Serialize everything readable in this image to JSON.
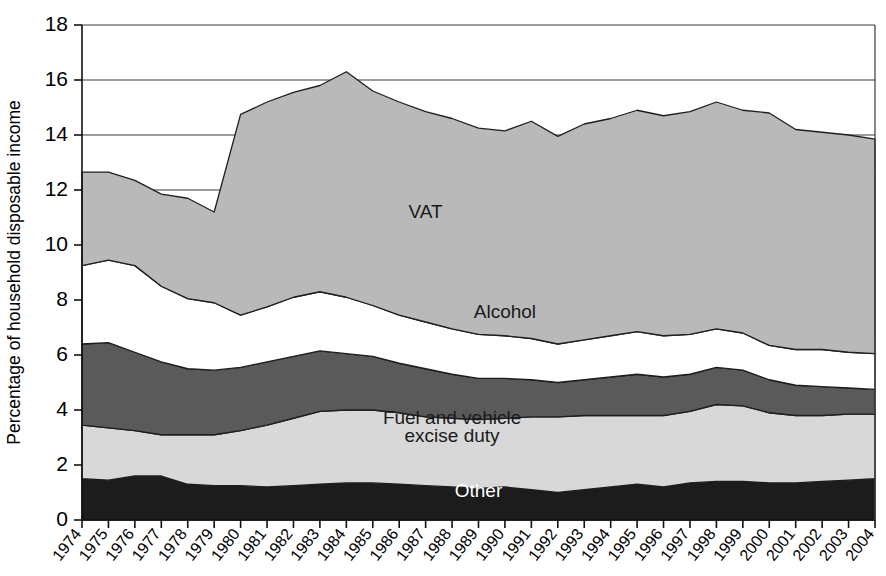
{
  "chart_data": {
    "type": "area",
    "stacked": true,
    "title": "",
    "subtitle": "",
    "xlabel": "",
    "ylabel": "Percentage of household disposable income",
    "ylim": [
      0,
      18
    ],
    "yticks": [
      0,
      2,
      4,
      6,
      8,
      10,
      12,
      14,
      16,
      18
    ],
    "ytick_labels": [
      "0",
      "2",
      "4",
      "6",
      "8",
      "10",
      "12",
      "14",
      "16",
      "18"
    ],
    "grid": "horizontal",
    "legend_position": "inline-labels",
    "categories": [
      "1974",
      "1975",
      "1976",
      "1977",
      "1978",
      "1979",
      "1980",
      "1981",
      "1982",
      "1983",
      "1984",
      "1985",
      "1986",
      "1987",
      "1988",
      "1989",
      "1990",
      "1991",
      "1992",
      "1993",
      "1994",
      "1995",
      "1996",
      "1997",
      "1998",
      "1999",
      "2000",
      "2001",
      "2002",
      "2003",
      "2004"
    ],
    "series": [
      {
        "name": "Other",
        "color": "#1c1c1c",
        "label_color": "light",
        "values": [
          1.5,
          1.45,
          1.6,
          1.6,
          1.3,
          1.25,
          1.25,
          1.2,
          1.25,
          1.3,
          1.35,
          1.35,
          1.3,
          1.25,
          1.2,
          1.15,
          1.2,
          1.1,
          1.0,
          1.1,
          1.2,
          1.3,
          1.2,
          1.35,
          1.4,
          1.4,
          1.35,
          1.35,
          1.4,
          1.45,
          1.5
        ]
      },
      {
        "name": "Fuel and vehicle excise duty",
        "color": "#d8d8d8",
        "label_color": "dark",
        "values": [
          1.95,
          1.9,
          1.65,
          1.5,
          1.8,
          1.85,
          2.0,
          2.25,
          2.45,
          2.65,
          2.65,
          2.65,
          2.6,
          2.5,
          2.5,
          2.5,
          2.5,
          2.65,
          2.75,
          2.7,
          2.6,
          2.5,
          2.6,
          2.6,
          2.8,
          2.75,
          2.55,
          2.45,
          2.4,
          2.4,
          2.35
        ]
      },
      {
        "name": "Tobacco",
        "color": "#5a5a5a",
        "label_color": "light",
        "values": [
          2.95,
          3.1,
          2.85,
          2.65,
          2.4,
          2.35,
          2.3,
          2.3,
          2.25,
          2.2,
          2.05,
          1.95,
          1.8,
          1.75,
          1.6,
          1.5,
          1.45,
          1.35,
          1.25,
          1.3,
          1.4,
          1.5,
          1.4,
          1.35,
          1.35,
          1.3,
          1.2,
          1.1,
          1.05,
          0.95,
          0.9
        ]
      },
      {
        "name": "Alcohol",
        "color": "#ffffff",
        "label_color": "dark",
        "values": [
          2.85,
          3.0,
          3.15,
          2.75,
          2.55,
          2.45,
          1.9,
          2.0,
          2.15,
          2.15,
          2.05,
          1.85,
          1.75,
          1.7,
          1.65,
          1.6,
          1.55,
          1.5,
          1.4,
          1.45,
          1.5,
          1.55,
          1.5,
          1.45,
          1.4,
          1.35,
          1.25,
          1.3,
          1.35,
          1.3,
          1.3
        ]
      },
      {
        "name": "VAT",
        "color": "#b9b9b9",
        "label_color": "dark",
        "values": [
          3.4,
          3.2,
          3.1,
          3.35,
          3.65,
          3.3,
          7.3,
          7.45,
          7.45,
          7.5,
          7.9,
          7.8,
          7.75,
          7.65,
          7.65,
          7.5,
          7.45,
          7.9,
          7.55,
          7.85,
          7.9,
          8.05,
          8.0,
          8.1,
          8.25,
          8.1,
          8.45,
          8.0,
          7.9,
          7.9,
          7.8
        ]
      }
    ],
    "stack_tops": {
      "Other": [
        1.5,
        1.45,
        1.6,
        1.6,
        1.3,
        1.25,
        1.25,
        1.2,
        1.25,
        1.3,
        1.35,
        1.35,
        1.3,
        1.25,
        1.2,
        1.15,
        1.2,
        1.1,
        1.0,
        1.1,
        1.2,
        1.3,
        1.2,
        1.35,
        1.4,
        1.4,
        1.35,
        1.35,
        1.4,
        1.45,
        1.5
      ],
      "Fuel and vehicle excise duty": [
        3.45,
        3.35,
        3.25,
        3.1,
        3.1,
        3.1,
        3.25,
        3.45,
        3.7,
        3.95,
        4.0,
        4.0,
        3.9,
        3.75,
        3.7,
        3.65,
        3.7,
        3.75,
        3.75,
        3.8,
        3.8,
        3.8,
        3.8,
        3.95,
        4.2,
        4.15,
        3.9,
        3.8,
        3.8,
        3.85,
        3.85
      ],
      "Tobacco": [
        6.4,
        6.45,
        6.1,
        5.75,
        5.5,
        5.45,
        5.55,
        5.75,
        5.95,
        6.15,
        6.05,
        5.95,
        5.7,
        5.5,
        5.3,
        5.15,
        5.15,
        5.1,
        5.0,
        5.1,
        5.2,
        5.3,
        5.2,
        5.3,
        5.55,
        5.45,
        5.1,
        4.9,
        4.85,
        4.8,
        4.75
      ],
      "Alcohol": [
        9.25,
        9.45,
        9.25,
        8.5,
        8.05,
        7.9,
        7.45,
        7.75,
        8.1,
        8.3,
        8.1,
        7.8,
        7.45,
        7.2,
        6.95,
        6.75,
        6.7,
        6.6,
        6.4,
        6.55,
        6.7,
        6.85,
        6.7,
        6.75,
        6.95,
        6.8,
        6.35,
        6.2,
        6.2,
        6.1,
        6.05
      ],
      "VAT": [
        12.65,
        12.65,
        12.35,
        11.85,
        11.7,
        11.2,
        14.75,
        15.2,
        15.55,
        15.8,
        16.3,
        15.6,
        15.2,
        14.85,
        14.6,
        14.25,
        14.15,
        14.5,
        13.95,
        14.4,
        14.6,
        14.9,
        14.7,
        14.85,
        15.2,
        14.9,
        14.8,
        14.2,
        14.1,
        14.0,
        13.85
      ]
    },
    "series_labels": [
      {
        "text": "VAT",
        "x_year": "1987",
        "y_value": 11.0,
        "color_class": "dark"
      },
      {
        "text": "Alcohol",
        "x_year": "1990",
        "y_value": 7.35,
        "color_class": "dark"
      },
      {
        "text": "Tobacco",
        "x_year": "1989",
        "y_value": 5.45,
        "color_class": "light"
      },
      {
        "text": "Fuel and vehicle",
        "x_year": "1988",
        "y_value": 3.5,
        "color_class": "dark"
      },
      {
        "text": "excise duty",
        "x_year": "1988",
        "y_value": 2.85,
        "color_class": "dark"
      },
      {
        "text": "Other",
        "x_year": "1989",
        "y_value": 0.85,
        "color_class": "light"
      }
    ]
  }
}
